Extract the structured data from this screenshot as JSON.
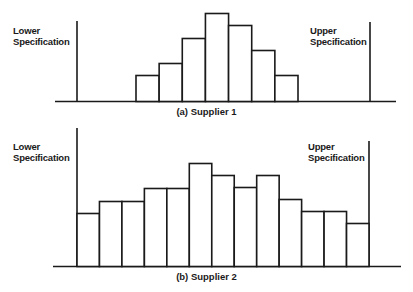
{
  "chart_data": [
    {
      "type": "bar",
      "title": "(a)  Supplier 1",
      "annotations": [
        "Lower Specification",
        "Upper Specification"
      ],
      "categories": [
        "1",
        "2",
        "3",
        "4",
        "5",
        "6",
        "7"
      ],
      "values": [
        26,
        38,
        63,
        88,
        76,
        51,
        26
      ],
      "xlim_bins": [
        77,
        370
      ],
      "note": "Histogram; values are relative bar heights in px above baseline"
    },
    {
      "type": "bar",
      "title": "(b)  Supplier 2",
      "annotations": [
        "Lower Specification",
        "Upper Specification"
      ],
      "categories": [
        "1",
        "2",
        "3",
        "4",
        "5",
        "6",
        "7",
        "8",
        "9",
        "10",
        "11",
        "12",
        "13"
      ],
      "values": [
        53,
        65,
        65,
        78,
        78,
        103,
        91,
        79,
        91,
        67,
        55,
        55,
        43
      ],
      "note": "Histogram; values are relative bar heights in px above baseline"
    }
  ],
  "top": {
    "lower_label_1": "Lower",
    "lower_label_2": "Specification",
    "upper_label_1": "Upper",
    "upper_label_2": "Specification",
    "caption": "(a)  Supplier 1"
  },
  "bottom": {
    "lower_label_1": "Lower",
    "lower_label_2": "Specification",
    "upper_label_1": "Upper",
    "upper_label_2": "Specification",
    "caption": "(b)  Supplier 2"
  }
}
